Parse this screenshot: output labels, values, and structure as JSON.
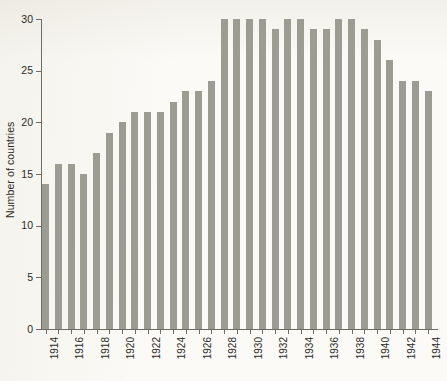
{
  "chart_data": {
    "type": "bar",
    "title": "",
    "xlabel": "",
    "ylabel": "Number of countries",
    "ylim": [
      0,
      30
    ],
    "y_ticks": [
      0,
      5,
      10,
      15,
      20,
      25,
      30
    ],
    "grid": false,
    "legend": null,
    "bar_color": "#9c9c93",
    "background_color": "#fbfaf6",
    "axis_color": "#6d6d68",
    "x_tick_label_rotation": 90,
    "x_tick_label_interval": 2,
    "categories": [
      "1914",
      "1915",
      "1916",
      "1917",
      "1918",
      "1919",
      "1920",
      "1921",
      "1922",
      "1923",
      "1924",
      "1925",
      "1926",
      "1927",
      "1928",
      "1929",
      "1930",
      "1931",
      "1932",
      "1933",
      "1934",
      "1935",
      "1936",
      "1937",
      "1938",
      "1939",
      "1940",
      "1941",
      "1942",
      "1943",
      "1944"
    ],
    "labelled_categories": [
      "1914",
      "1916",
      "1918",
      "1920",
      "1922",
      "1924",
      "1926",
      "1928",
      "1930",
      "1932",
      "1934",
      "1936",
      "1938",
      "1940",
      "1942",
      "1944"
    ],
    "values": [
      14,
      16,
      16,
      15,
      17,
      19,
      20,
      21,
      21,
      21,
      22,
      23,
      23,
      24,
      30,
      30,
      30,
      30,
      29,
      30,
      30,
      29,
      29,
      30,
      30,
      29,
      28,
      26,
      24,
      24,
      23
    ]
  }
}
